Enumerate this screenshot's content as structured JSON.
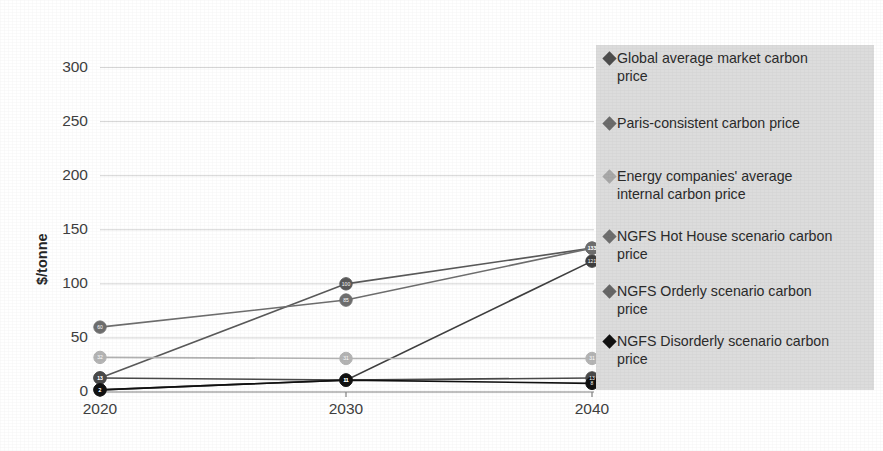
{
  "chart_data": {
    "type": "line",
    "title": "",
    "xlabel": "",
    "ylabel": "$/tonne",
    "x": [
      "2020",
      "2030",
      "2040"
    ],
    "categories": [
      "2020",
      "2030",
      "2040"
    ],
    "xticklabels": [
      "2020",
      "2030",
      "2040"
    ],
    "yticklabels": [
      "0",
      "50",
      "100",
      "150",
      "200",
      "250",
      "300"
    ],
    "yticks": [
      0,
      50,
      100,
      150,
      200,
      250,
      300
    ],
    "ylim": [
      0,
      325
    ],
    "grid": "horizontal",
    "legend_position": "right",
    "series": [
      {
        "name": "Global average market carbon price",
        "values": [
          2,
          11,
          121
        ],
        "point_labels": [
          "2",
          "11",
          "121"
        ],
        "color": "#3f3f3f",
        "marker": "circle"
      },
      {
        "name": "Paris-consistent carbon price",
        "values": [
          13,
          100,
          133
        ],
        "point_labels": [
          "13",
          "100",
          "133"
        ],
        "color": "#595959",
        "marker": "circle"
      },
      {
        "name": "Energy companies' average internal carbon price",
        "values": [
          32,
          31,
          31
        ],
        "point_labels": [
          "32",
          "31",
          "31"
        ],
        "color": "#b4b4b4",
        "marker": "circle"
      },
      {
        "name": "NGFS Hot House scenario carbon price",
        "values": [
          60,
          85,
          133
        ],
        "point_labels": [
          "60",
          "85",
          "133"
        ],
        "color": "#6e6e6e",
        "marker": "circle"
      },
      {
        "name": "NGFS Orderly scenario carbon price",
        "values": [
          13,
          11,
          13
        ],
        "point_labels": [
          "13",
          "11",
          "13"
        ],
        "color": "#4a4a4a",
        "marker": "circle"
      },
      {
        "name": "NGFS Disorderly scenario carbon price",
        "values": [
          2,
          11,
          8
        ],
        "point_labels": [
          "2",
          "11",
          "8"
        ],
        "color": "#111111",
        "marker": "circle"
      }
    ],
    "colors": {
      "gridline": "#d4d4d4",
      "axis": "#808080",
      "legend_background": "#dcdcdc",
      "text": "#3f3f3f"
    }
  },
  "legend": {
    "items": [
      {
        "label": "Global average market carbon\nprice",
        "marker_color": "#4d4d4d"
      },
      {
        "label": "Paris-consistent carbon price",
        "marker_color": "#6b6b6b"
      },
      {
        "label": "Energy companies' average\ninternal carbon price",
        "marker_color": "#a8a8a8"
      },
      {
        "label": "NGFS Hot House scenario carbon\nprice",
        "marker_color": "#6e6e6e"
      },
      {
        "label": "NGFS Orderly scenario carbon\nprice",
        "marker_color": "#666666"
      },
      {
        "label": "NGFS Disorderly scenario carbon\nprice",
        "marker_color": "#111111"
      }
    ]
  }
}
